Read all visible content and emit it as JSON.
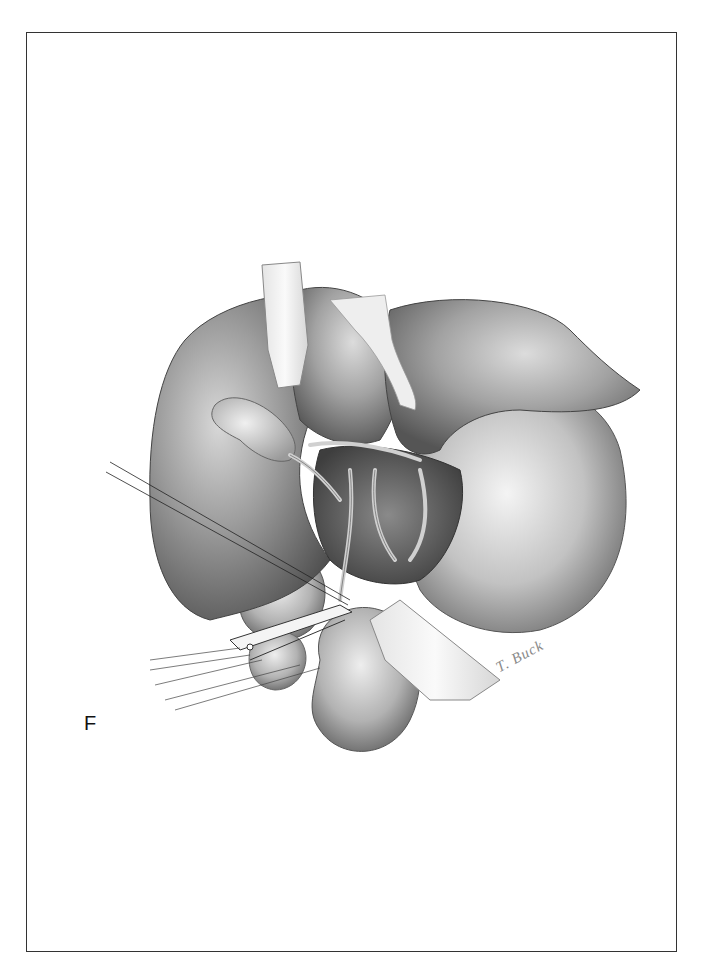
{
  "figure": {
    "panel_label": "F",
    "signature": "T. Buck",
    "colors": {
      "border": "#333333",
      "background": "#ffffff",
      "organ_dark": "#5a5a5a",
      "organ_mid": "#9a9a9a",
      "organ_light": "#e6e6e6",
      "retractor": "#f2f2f2"
    }
  }
}
